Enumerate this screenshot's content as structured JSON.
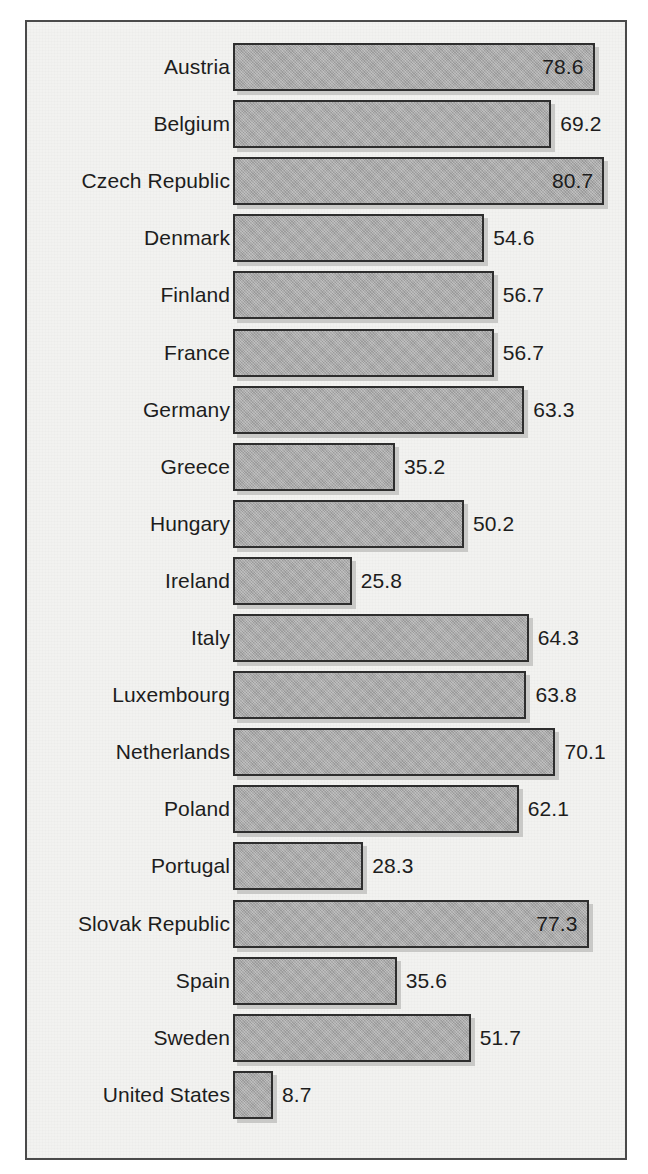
{
  "figure": {
    "frame_border_color": "#4a4a4a",
    "background_color": "#f2f2f0",
    "bar_fill_color": "#a9a9a9",
    "bar_border_color": "#2e2e2e",
    "bar_shadow_color": "#c9c9c7",
    "text_color": "#1d1d1d"
  },
  "chart_data": {
    "type": "bar",
    "orientation": "horizontal",
    "title": "",
    "subtitle": "",
    "xlabel": "",
    "ylabel": "",
    "xlim": [
      0,
      80.7
    ],
    "grid": false,
    "legend": null,
    "axis_visible": false,
    "tick_labels_visible": false,
    "data_labels": true,
    "categories": [
      "Austria",
      "Belgium",
      "Czech Republic",
      "Denmark",
      "Finland",
      "France",
      "Germany",
      "Greece",
      "Hungary",
      "Ireland",
      "Italy",
      "Luxembourg",
      "Netherlands",
      "Poland",
      "Portugal",
      "Slovak Republic",
      "Spain",
      "Sweden",
      "United States"
    ],
    "values": [
      78.6,
      69.2,
      80.7,
      54.6,
      56.7,
      56.7,
      63.3,
      35.2,
      50.2,
      25.8,
      64.3,
      63.8,
      70.1,
      62.1,
      28.3,
      77.3,
      35.6,
      51.7,
      8.7
    ],
    "value_labels": [
      "78.6",
      "69.2",
      "80.7",
      "54.6",
      "56.7",
      "56.7",
      "63.3",
      "35.2",
      "50.2",
      "25.8",
      "64.3",
      "63.8",
      "70.1",
      "62.1",
      "28.3",
      "77.3",
      "35.6",
      "51.7",
      "8.7"
    ],
    "label_placement": [
      "inside",
      "outside",
      "inside",
      "outside",
      "outside",
      "outside",
      "outside",
      "outside",
      "outside",
      "outside",
      "outside",
      "outside",
      "outside",
      "outside",
      "outside",
      "inside",
      "outside",
      "outside",
      "outside"
    ]
  }
}
